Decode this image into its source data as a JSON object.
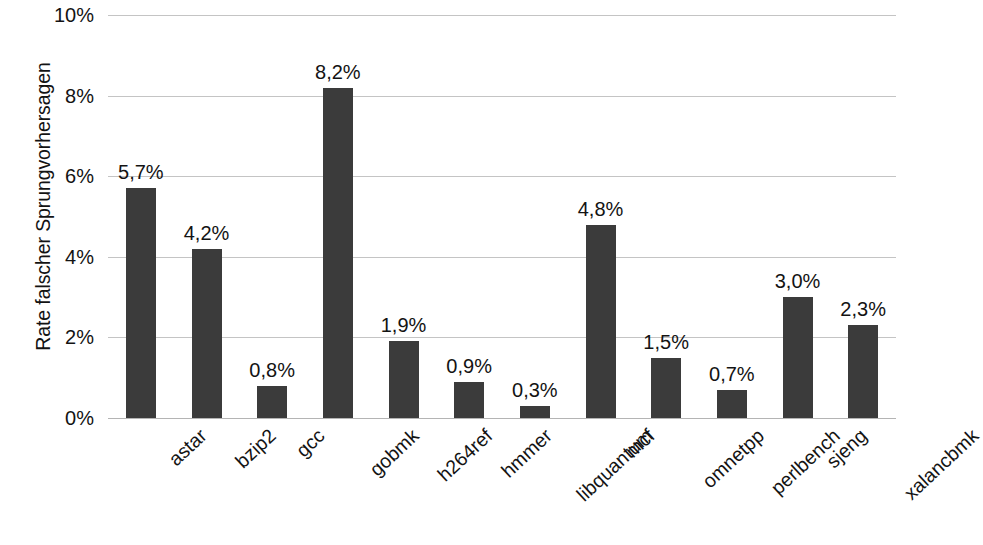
{
  "chart_data": {
    "type": "bar",
    "title": "",
    "subtitle": "",
    "xlabel": "",
    "ylabel": "Rate falscher Sprungvorhersagen",
    "ylim": [
      0,
      10
    ],
    "grid": true,
    "legend": false,
    "legend_position": "none",
    "y_tick_labels": [
      "10%",
      "8%",
      "6%",
      "4%",
      "2%",
      "0%"
    ],
    "y_ticks": [
      10,
      8,
      6,
      4,
      2,
      0
    ],
    "categories": [
      "astar",
      "bzip2",
      "gcc",
      "gobmk",
      "h264ref",
      "hmmer",
      "libquantum",
      "mcf",
      "omnetpp",
      "perlbench",
      "sjeng",
      "xalancbmk"
    ],
    "values": [
      5.7,
      4.2,
      0.8,
      8.2,
      1.9,
      0.9,
      0.3,
      4.8,
      1.5,
      0.7,
      3.0,
      2.3
    ],
    "data_labels": [
      "5,7%",
      "4,2%",
      "0,8%",
      "8,2%",
      "1,9%",
      "0,9%",
      "0,3%",
      "4,8%",
      "1,5%",
      "0,7%",
      "3,0%",
      "2,3%"
    ],
    "bar_color": "#3b3b3b",
    "gridline_color": "#c4c4c4",
    "background_color": "#ffffff",
    "text_color": "#131313"
  }
}
